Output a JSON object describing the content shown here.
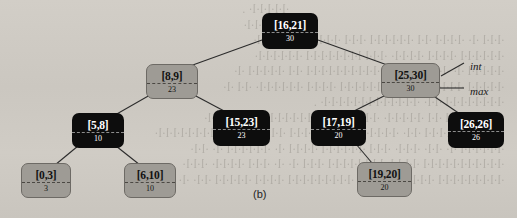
{
  "figure": {
    "caption": "(b)",
    "type": "interval-tree",
    "annotations": [
      {
        "name": "int-label",
        "text": "int",
        "x": 470,
        "y": 60,
        "leader": {
          "x1": 441,
          "y1": 76,
          "x2": 464,
          "y2": 63
        },
        "leader_style": "diagonal"
      },
      {
        "name": "max-label",
        "text": "max",
        "x": 470,
        "y": 85,
        "leader": {
          "x1": 440,
          "y1": 88,
          "x2": 464,
          "y2": 88
        },
        "leader_style": "horizontal"
      }
    ],
    "nodes": [
      {
        "id": "n16_21",
        "int": "[16,21]",
        "max": "30",
        "color": "black",
        "x": 262,
        "y": 13,
        "w": 56,
        "h": 36
      },
      {
        "id": "n8_9",
        "int": "[8,9]",
        "max": "23",
        "color": "gray",
        "x": 146,
        "y": 64,
        "w": 52,
        "h": 35
      },
      {
        "id": "n25_30",
        "int": "[25,30]",
        "max": "30",
        "color": "gray",
        "x": 381,
        "y": 63,
        "w": 59,
        "h": 35
      },
      {
        "id": "n5_8",
        "int": "[5,8]",
        "max": "10",
        "color": "black",
        "x": 72,
        "y": 113,
        "w": 52,
        "h": 35
      },
      {
        "id": "n15_23",
        "int": "[15,23]",
        "max": "23",
        "color": "black",
        "x": 213,
        "y": 110,
        "w": 57,
        "h": 36
      },
      {
        "id": "n17_19",
        "int": "[17,19]",
        "max": "20",
        "color": "black",
        "x": 311,
        "y": 110,
        "w": 55,
        "h": 36
      },
      {
        "id": "n26_26",
        "int": "[26,26]",
        "max": "26",
        "color": "black",
        "x": 448,
        "y": 112,
        "w": 56,
        "h": 36
      },
      {
        "id": "n0_3",
        "int": "[0,3]",
        "max": "3",
        "color": "gray",
        "x": 21,
        "y": 163,
        "w": 50,
        "h": 35
      },
      {
        "id": "n6_10",
        "int": "[6,10]",
        "max": "10",
        "color": "gray",
        "x": 124,
        "y": 163,
        "w": 52,
        "h": 35
      },
      {
        "id": "n19_20",
        "int": "[19,20]",
        "max": "20",
        "color": "gray",
        "x": 357,
        "y": 162,
        "w": 55,
        "h": 35
      }
    ],
    "edges": [
      {
        "from": "n16_21",
        "to": "n8_9",
        "x1": 262,
        "y1": 40,
        "x2": 190,
        "y2": 66
      },
      {
        "from": "n16_21",
        "to": "n25_30",
        "x1": 318,
        "y1": 40,
        "x2": 390,
        "y2": 66
      },
      {
        "from": "n8_9",
        "to": "n5_8",
        "x1": 150,
        "y1": 95,
        "x2": 115,
        "y2": 115
      },
      {
        "from": "n8_9",
        "to": "n15_23",
        "x1": 194,
        "y1": 95,
        "x2": 226,
        "y2": 112
      },
      {
        "from": "n5_8",
        "to": "n0_3",
        "x1": 78,
        "y1": 146,
        "x2": 55,
        "y2": 165
      },
      {
        "from": "n5_8",
        "to": "n6_10",
        "x1": 116,
        "y1": 146,
        "x2": 140,
        "y2": 165
      },
      {
        "from": "n25_30",
        "to": "n17_19",
        "x1": 386,
        "y1": 95,
        "x2": 352,
        "y2": 112
      },
      {
        "from": "n25_30",
        "to": "n26_26",
        "x1": 432,
        "y1": 95,
        "x2": 460,
        "y2": 114
      },
      {
        "from": "n17_19",
        "to": "n19_20",
        "x1": 356,
        "y1": 144,
        "x2": 372,
        "y2": 163
      }
    ],
    "ghost_text": [
      "",
      "                                                                        ·l·l·l·l·l· .",
      "                                                                     ·l· ·l·l·l·l·l·",
      "",
      "  ·l·l·l ·l· ·l·l·l·l ·l·l ·l·l·l·l·l·l ·l·l·l ·l·l·l·l·l· ·l·l ·l·l·l·",
      "  ·l·l·l·l·l·l ·l·l·l·l ·l·l·l·l· ·l·l·l·l·l·l·l·l·l·l·l ·l·l·l·l·l·l·",
      "  ·l·l·l·l·l ·l· ·l·l·l·l·l·l ·l·l· ·l·l·l·l·l·l·l·l·l·l ·l·l ·l·l·l·l·l ·l·",
      "  ·l·l·l·l·l ·l·l·l·l·l ·l·l·l·l·l ·l·l·l·l·l·l ·l·l·l·l ·l·l·l·l·l·l· ·l·l ·l·",
      "  ·l·l·l·l·l·l·l·l ·l·l· ·l·l·l·l·l·l·l·l·l·l·l·l·l· .",
      "  ·l·l·l·l·l·l·l·l ·l·l ·l·l·l·l·l· ·l·l·l·l·l ·l·l ·l·l·l·l·l·l·l·l·l ·l·l·l·l·l·l·",
      "  ·l·l ·l·l·l ·l·l·l·l·l ·l·l· ·l·l·l·l·l·l·l·l ·l·l ·l·l·l·l ·l·l ·l·l·l·l ·l·l ·l·l·l·l·l·l·l·l·",
      "  ·l·l·l·l·l·l ·l· ·l·l· ·l·l·l· ·l·l·l ·l·l·l·l·l·l ·l·l·l·l ·l· ·l·l·l·l·l·l ·l· ·l·l·",
      "  ·l·l·l·l·l·l·l·l·l·l·l ·l·l·l·l ·l·l·l·l·l·l·l·l ·l·l·l ·l· ·l· ·l·l·l ·l·l·l·l· ·l·l·l·",
      "  ·l·l·l·l·l·l·l·l·l ·l·l·l·l·l ·l·l·l·l·l ·l·l·l·l·l·l·l·l·l ·l·l·l·l ·l·l·l·l·l ·l·l· ·l·"
    ]
  }
}
